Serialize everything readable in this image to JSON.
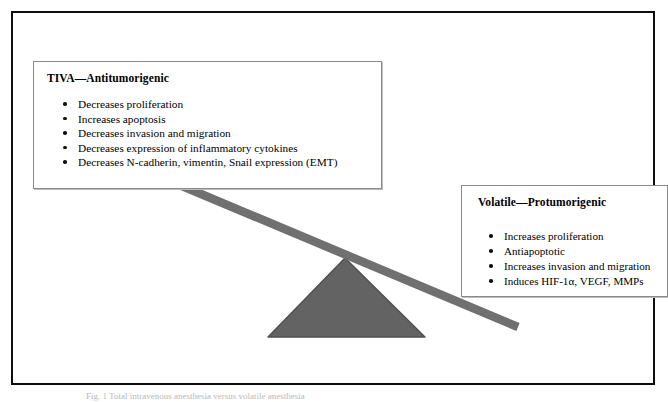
{
  "figure": {
    "background_color": "#ffffff",
    "frame_color": "#0d0d0d",
    "beam_color": "#707070",
    "fulcrum_fill": "#636363",
    "fulcrum_stroke": "#4a4a4a",
    "caption": "Fig. 1  Total intravenous anesthesia versus volatile anesthesia"
  },
  "left_panel": {
    "title": "TIVA—Antitumorigenic",
    "bullets": [
      "Decreases proliferation",
      "Increases apoptosis",
      "Decreases invasion and migration",
      "Decreases expression of inflammatory cytokines",
      "Decreases N-cadherin, vimentin, Snail expression (EMT)"
    ]
  },
  "right_panel": {
    "title": "Volatile—Protumorigenic",
    "bullets": [
      "Increases proliferation",
      "Antiapoptotic",
      "Increases invasion and migration",
      "Induces HIF-1α, VEGF, MMPs"
    ]
  }
}
